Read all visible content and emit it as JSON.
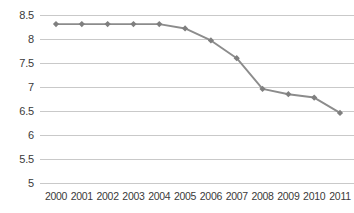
{
  "chart_data": {
    "type": "line",
    "title": "",
    "subtitle": "",
    "xlabel": "",
    "ylabel": "",
    "categories": [
      "2000",
      "2001",
      "2002",
      "2003",
      "2004",
      "2005",
      "2006",
      "2007",
      "2008",
      "2009",
      "2010",
      "2011"
    ],
    "series": [
      {
        "name": "",
        "values": [
          8.31,
          8.31,
          8.31,
          8.31,
          8.31,
          8.22,
          7.97,
          7.6,
          6.96,
          6.85,
          6.78,
          6.46
        ]
      }
    ],
    "ylim": [
      5,
      8.5
    ],
    "yticks": [
      8.5,
      8,
      7.5,
      7,
      6.5,
      6,
      5.5,
      5
    ],
    "ytick_labels": [
      "8.5",
      "8",
      "7.5",
      "7",
      "6.5",
      "6",
      "5.5",
      "5"
    ],
    "grid": "horizontal",
    "legend": "none",
    "marker": "diamond",
    "colors": {
      "line": "#8c8c8c",
      "marker": "#7f7f7f",
      "gridline": "#c9c9c9",
      "tick_label": "#3a3a3a",
      "background": "#ffffff"
    },
    "annotations": []
  }
}
